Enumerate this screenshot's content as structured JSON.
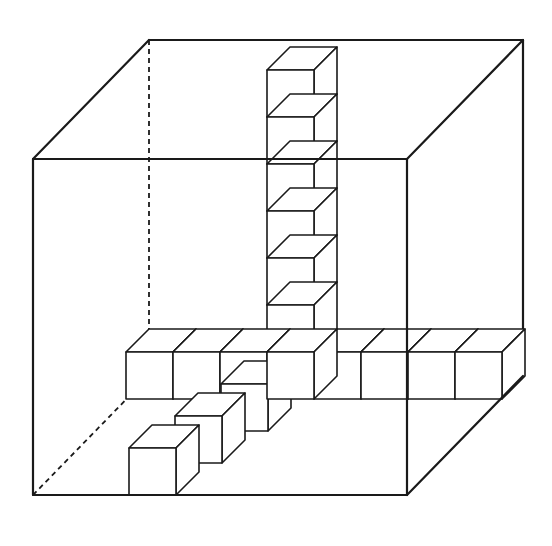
{
  "figure": {
    "colors": {
      "line": "#1a1a1a",
      "background": "#ffffff",
      "face": "#ffffff"
    },
    "outer_cube": {
      "front": {
        "x1": 33,
        "y1": 159,
        "x2": 407,
        "y2": 495
      },
      "depth_offset": {
        "dx": 116,
        "dy": -119
      }
    },
    "unit": {
      "size": 47,
      "dx": 23,
      "dy": -23
    },
    "vertical_column": {
      "front_x": 267,
      "top_y": 63,
      "bottom_y": 352,
      "cube_count": 6
    },
    "horizontal_row": {
      "left_x": 126,
      "top_y": 352,
      "cube_count": 8
    },
    "depth_row": {
      "cube_count": 3
    }
  }
}
